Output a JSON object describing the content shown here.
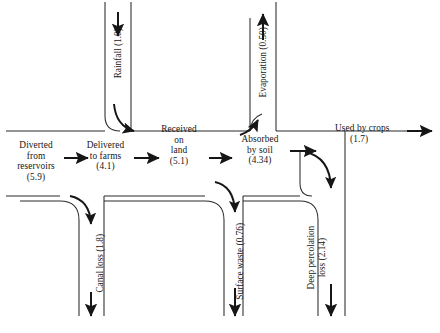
{
  "diagram": {
    "units_note": "",
    "horizontal_nodes": [
      {
        "id": "diverted",
        "label": "Diverted\nfrom\nreservoirs\n(5.9)",
        "value": 5.9,
        "name": "Diverted from reservoirs"
      },
      {
        "id": "delivered",
        "label": "Delivered\nto farms\n(4.1)",
        "value": 4.1,
        "name": "Delivered to farms"
      },
      {
        "id": "received",
        "label": "Received\non\nland\n(5.1)",
        "value": 5.1,
        "name": "Received on land"
      },
      {
        "id": "absorbed",
        "label": "Absorbed\nby soil\n(4.34)",
        "value": 4.34,
        "name": "Absorbed by soil"
      },
      {
        "id": "used",
        "label": "Used by crops",
        "sub": "(1.7)",
        "value": 1.7,
        "name": "Used by crops"
      }
    ],
    "vertical_nodes": [
      {
        "id": "rainfall",
        "label": "Rainfall (1.0)",
        "value": 1.0,
        "direction": "in-down",
        "name": "Rainfall"
      },
      {
        "id": "evaporation",
        "label": "Evaporation (0.50)",
        "value": 0.5,
        "direction": "out-up",
        "name": "Evaporation"
      },
      {
        "id": "canal-loss",
        "label": "Canal loss (1.8)",
        "value": 1.8,
        "direction": "out-down",
        "name": "Canal loss"
      },
      {
        "id": "surface-waste",
        "label": "Surface waste (0.76)",
        "value": 0.76,
        "direction": "out-down",
        "name": "Surface waste"
      },
      {
        "id": "deep-percolation",
        "label": "Deep percolation\nloss (2.14)",
        "value": 2.14,
        "direction": "out-down",
        "name": "Deep percolation loss"
      }
    ],
    "colors": {
      "ink": "#161616",
      "line": "#2b2b2b",
      "background": "#ffffff"
    }
  }
}
